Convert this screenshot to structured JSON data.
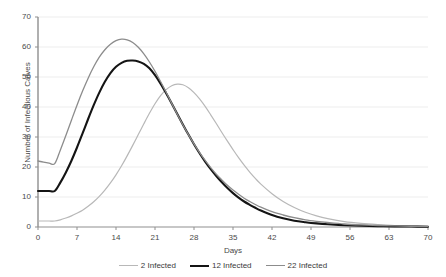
{
  "chart_data": {
    "type": "line",
    "title": "",
    "xlabel": "Days",
    "ylabel": "Number of Infectious Calves",
    "xlim": [
      0,
      70
    ],
    "ylim": [
      0,
      70
    ],
    "grid": "horizontal",
    "legend_position": "bottom",
    "xticks": [
      0,
      7,
      14,
      21,
      28,
      35,
      42,
      49,
      56,
      63,
      70
    ],
    "yticks": [
      0,
      10,
      20,
      30,
      40,
      50,
      60,
      70
    ],
    "x": [
      0,
      1,
      2,
      3,
      4,
      5,
      6,
      7,
      8,
      9,
      10,
      11,
      12,
      13,
      14,
      15,
      16,
      17,
      18,
      19,
      20,
      21,
      22,
      23,
      24,
      25,
      26,
      27,
      28,
      29,
      30,
      31,
      32,
      33,
      34,
      35,
      36,
      37,
      38,
      39,
      40,
      42,
      44,
      46,
      48,
      50,
      52,
      55,
      58,
      61,
      64,
      67,
      70
    ],
    "series": [
      {
        "name": "2 Infected",
        "color": "#b8b8b8",
        "width": 1.2,
        "values": [
          2,
          2,
          2,
          2,
          2.4,
          3,
          3.7,
          4.6,
          5.6,
          6.9,
          8.4,
          10.2,
          12.3,
          14.7,
          17.4,
          20.4,
          23.7,
          27.2,
          30.8,
          34.4,
          37.9,
          41.1,
          43.8,
          45.8,
          47.1,
          47.6,
          47.4,
          46.4,
          44.8,
          42.7,
          40.2,
          37.4,
          34.5,
          31.5,
          28.6,
          25.8,
          23.1,
          20.6,
          18.3,
          16.2,
          14.3,
          11.1,
          8.5,
          6.5,
          4.9,
          3.7,
          2.8,
          1.8,
          1.2,
          0.8,
          0.5,
          0.35,
          0.25
        ]
      },
      {
        "name": "12 Infected",
        "color": "#141414",
        "width": 2.1,
        "values": [
          12,
          12,
          12,
          12,
          14.8,
          18.2,
          22.1,
          26.5,
          31.2,
          36.0,
          40.6,
          44.8,
          48.4,
          51.3,
          53.4,
          54.7,
          55.4,
          55.5,
          55.2,
          54.4,
          52.9,
          50.6,
          47.8,
          44.6,
          41.2,
          37.7,
          34.2,
          30.8,
          27.6,
          24.6,
          21.8,
          19.3,
          17.0,
          14.9,
          13.0,
          11.3,
          9.8,
          8.5,
          7.4,
          6.4,
          5.5,
          4.0,
          2.9,
          2.1,
          1.6,
          1.2,
          0.9,
          0.6,
          0.4,
          0.3,
          0.2,
          0.15,
          0.1
        ]
      },
      {
        "name": "22 Infected",
        "color": "#8c8c8c",
        "width": 1.3,
        "values": [
          22,
          21.6,
          21.3,
          21.1,
          25.6,
          30.5,
          35.6,
          40.6,
          45.3,
          49.6,
          53.4,
          56.6,
          59.1,
          60.9,
          62.1,
          62.6,
          62.4,
          61.5,
          59.9,
          57.7,
          55.0,
          51.9,
          48.5,
          44.9,
          41.2,
          37.6,
          34.1,
          30.8,
          27.7,
          24.8,
          22.2,
          19.8,
          17.6,
          15.7,
          13.9,
          12.3,
          10.9,
          9.6,
          8.5,
          7.5,
          6.6,
          5.1,
          4.0,
          3.1,
          2.4,
          1.9,
          1.5,
          1.0,
          0.7,
          0.5,
          0.35,
          0.25,
          0.2
        ]
      }
    ],
    "legend": [
      {
        "label": "2 Infected",
        "color": "#b8b8b8",
        "width": 1.2
      },
      {
        "label": "12 Infected",
        "color": "#141414",
        "width": 2.1
      },
      {
        "label": "22 Infected",
        "color": "#8c8c8c",
        "width": 1.3
      }
    ],
    "axis_color": "#8f8f8f",
    "grid_color": "#ededed"
  }
}
